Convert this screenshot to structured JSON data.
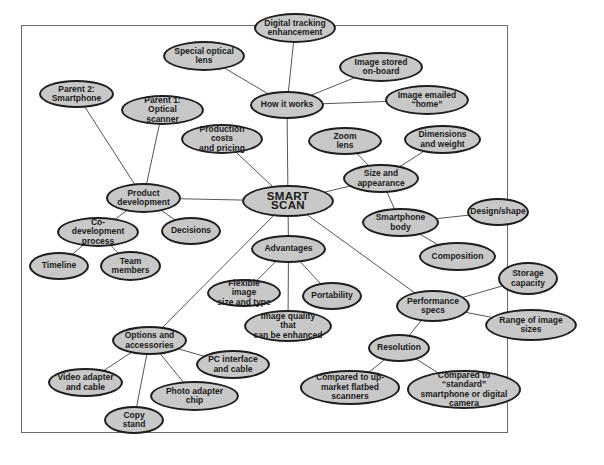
{
  "diagram": {
    "type": "mind-map",
    "colors": {
      "node_fill": "#c8c8c8",
      "node_border": "#1e1e1e",
      "edge": "#555555",
      "frame": "#6a6a6a"
    },
    "root": {
      "id": "smart_scan",
      "label": "SMART SCAN"
    },
    "nodes": [
      {
        "id": "smart_scan",
        "label": "SMART SCAN",
        "x": 242,
        "y": 185,
        "w": 92,
        "h": 32,
        "root": true
      },
      {
        "id": "how_it_works",
        "label": "How it works",
        "x": 250,
        "y": 91,
        "w": 74,
        "h": 28
      },
      {
        "id": "special_lens",
        "label": "Special optical\nlens",
        "x": 163,
        "y": 41,
        "w": 82,
        "h": 30
      },
      {
        "id": "digital_tracking",
        "label": "Digital tracking\nenhancement",
        "x": 254,
        "y": 13,
        "w": 82,
        "h": 30
      },
      {
        "id": "image_stored",
        "label": "Image stored\non-board",
        "x": 339,
        "y": 52,
        "w": 84,
        "h": 30
      },
      {
        "id": "image_emailed",
        "label": "Image emailed\n“home”",
        "x": 385,
        "y": 85,
        "w": 84,
        "h": 30
      },
      {
        "id": "parent2",
        "label": "Parent 2:\nSmartphone",
        "x": 39,
        "y": 80,
        "w": 75,
        "h": 28
      },
      {
        "id": "parent1",
        "label": "Parent 1: Optical\nscanner",
        "x": 121,
        "y": 95,
        "w": 83,
        "h": 30
      },
      {
        "id": "production_costs",
        "label": "Production costs\nand pricing",
        "x": 181,
        "y": 124,
        "w": 82,
        "h": 30
      },
      {
        "id": "product_dev",
        "label": "Product\ndevelopment",
        "x": 106,
        "y": 183,
        "w": 75,
        "h": 30
      },
      {
        "id": "co_dev",
        "label": "Co-development\nprocess",
        "x": 57,
        "y": 217,
        "w": 82,
        "h": 30
      },
      {
        "id": "decisions",
        "label": "Decisions",
        "x": 161,
        "y": 217,
        "w": 60,
        "h": 28
      },
      {
        "id": "timeline",
        "label": "Timeline",
        "x": 29,
        "y": 252,
        "w": 60,
        "h": 28
      },
      {
        "id": "team_members",
        "label": "Team\nmembers",
        "x": 100,
        "y": 251,
        "w": 61,
        "h": 30
      },
      {
        "id": "zoom_lens",
        "label": "Zoom\nlens",
        "x": 308,
        "y": 127,
        "w": 74,
        "h": 28
      },
      {
        "id": "dimensions",
        "label": "Dimensions\nand weight",
        "x": 404,
        "y": 125,
        "w": 77,
        "h": 29
      },
      {
        "id": "size_appearance",
        "label": "Size and\nappearance",
        "x": 343,
        "y": 164,
        "w": 76,
        "h": 29
      },
      {
        "id": "smartphone_body",
        "label": "Smartphone\nbody",
        "x": 362,
        "y": 208,
        "w": 77,
        "h": 29
      },
      {
        "id": "design_shape",
        "label": "Design/shape",
        "x": 467,
        "y": 198,
        "w": 62,
        "h": 28
      },
      {
        "id": "composition",
        "label": "Composition",
        "x": 419,
        "y": 242,
        "w": 77,
        "h": 29
      },
      {
        "id": "advantages",
        "label": "Advantages",
        "x": 251,
        "y": 235,
        "w": 75,
        "h": 28
      },
      {
        "id": "flexible_image",
        "label": "Flexible image\nsize and type",
        "x": 207,
        "y": 279,
        "w": 74,
        "h": 28
      },
      {
        "id": "portability",
        "label": "Portability",
        "x": 302,
        "y": 282,
        "w": 60,
        "h": 28
      },
      {
        "id": "image_quality",
        "label": "Image quality that\ncan be enhanced",
        "x": 244,
        "y": 310,
        "w": 88,
        "h": 32
      },
      {
        "id": "performance",
        "label": "Performance\nspecs",
        "x": 396,
        "y": 290,
        "w": 74,
        "h": 32
      },
      {
        "id": "storage",
        "label": "Storage\ncapacity",
        "x": 498,
        "y": 262,
        "w": 60,
        "h": 33
      },
      {
        "id": "range_sizes",
        "label": "Range of image\nsizes",
        "x": 485,
        "y": 309,
        "w": 92,
        "h": 32
      },
      {
        "id": "resolution",
        "label": "Resolution",
        "x": 368,
        "y": 334,
        "w": 62,
        "h": 28
      },
      {
        "id": "upmarket",
        "label": "Compared to up-\nmarket flatbed scanners",
        "x": 300,
        "y": 370,
        "w": 100,
        "h": 35
      },
      {
        "id": "standard",
        "label": "Compared to “standard”\nsmartphone or digital\ncamera",
        "x": 407,
        "y": 370,
        "w": 114,
        "h": 39
      },
      {
        "id": "options",
        "label": "Options and\naccessories",
        "x": 112,
        "y": 326,
        "w": 75,
        "h": 29
      },
      {
        "id": "pc_interface",
        "label": "PC interface\nand cable",
        "x": 196,
        "y": 350,
        "w": 74,
        "h": 29
      },
      {
        "id": "video_adapter",
        "label": "Video adapter\nand cable",
        "x": 48,
        "y": 368,
        "w": 75,
        "h": 29
      },
      {
        "id": "photo_adapter",
        "label": "Photo adapter\nchip",
        "x": 150,
        "y": 381,
        "w": 89,
        "h": 30
      },
      {
        "id": "copy_stand",
        "label": "Copy stand",
        "x": 104,
        "y": 406,
        "w": 60,
        "h": 28
      }
    ],
    "edges": [
      [
        "smart_scan",
        "how_it_works"
      ],
      [
        "how_it_works",
        "special_lens"
      ],
      [
        "how_it_works",
        "digital_tracking"
      ],
      [
        "how_it_works",
        "image_stored"
      ],
      [
        "how_it_works",
        "image_emailed"
      ],
      [
        "smart_scan",
        "production_costs"
      ],
      [
        "smart_scan",
        "product_dev"
      ],
      [
        "product_dev",
        "parent2"
      ],
      [
        "product_dev",
        "parent1"
      ],
      [
        "product_dev",
        "co_dev"
      ],
      [
        "product_dev",
        "decisions"
      ],
      [
        "co_dev",
        "timeline"
      ],
      [
        "co_dev",
        "team_members"
      ],
      [
        "smart_scan",
        "size_appearance"
      ],
      [
        "size_appearance",
        "zoom_lens"
      ],
      [
        "size_appearance",
        "dimensions"
      ],
      [
        "size_appearance",
        "smartphone_body"
      ],
      [
        "smartphone_body",
        "design_shape"
      ],
      [
        "smartphone_body",
        "composition"
      ],
      [
        "smart_scan",
        "advantages"
      ],
      [
        "advantages",
        "flexible_image"
      ],
      [
        "advantages",
        "portability"
      ],
      [
        "advantages",
        "image_quality"
      ],
      [
        "smart_scan",
        "performance"
      ],
      [
        "performance",
        "storage"
      ],
      [
        "performance",
        "range_sizes"
      ],
      [
        "performance",
        "resolution"
      ],
      [
        "resolution",
        "upmarket"
      ],
      [
        "resolution",
        "standard"
      ],
      [
        "smart_scan",
        "options"
      ],
      [
        "options",
        "pc_interface"
      ],
      [
        "options",
        "video_adapter"
      ],
      [
        "options",
        "photo_adapter"
      ],
      [
        "options",
        "copy_stand"
      ]
    ]
  }
}
